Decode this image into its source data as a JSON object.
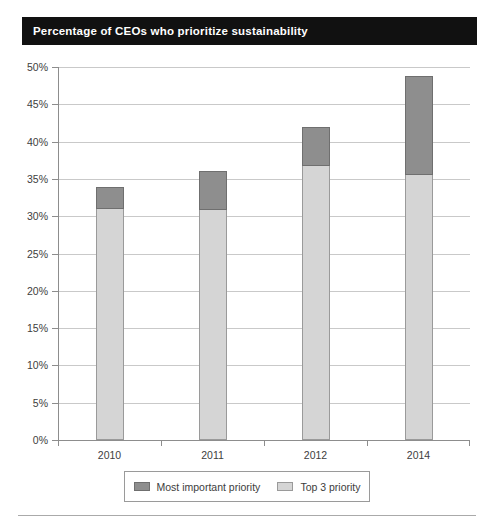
{
  "title": "Percentage of CEOs who prioritize sustainability",
  "colors": {
    "title_background": "#111111",
    "title_text": "#ffffff",
    "most_important": "#8e8e8e",
    "top3": "#d5d5d5",
    "axis": "#8d8d8d",
    "grid": "#c9c9c9"
  },
  "chart_data": {
    "type": "bar",
    "stacked": true,
    "title": "Percentage of CEOs who prioritize sustainability",
    "xlabel": "",
    "ylabel": "",
    "categories": [
      "2010",
      "2011",
      "2012",
      "2014"
    ],
    "series": [
      {
        "name": "Top 3 priority",
        "color": "#d5d5d5",
        "values": [
          30.9,
          30.8,
          36.7,
          35.5
        ]
      },
      {
        "name": "Most important priority",
        "color": "#8e8e8e",
        "values": [
          3.0,
          5.2,
          5.2,
          13.3
        ]
      }
    ],
    "totals": [
      33.9,
      36.0,
      41.9,
      48.8
    ],
    "ylim": [
      0,
      50
    ],
    "ytick_values": [
      0,
      5,
      10,
      15,
      20,
      25,
      30,
      35,
      40,
      45,
      50
    ],
    "ytick_labels": [
      "0%",
      "5%",
      "10%",
      "15%",
      "20%",
      "25%",
      "30%",
      "35%",
      "40%",
      "45%",
      "50%"
    ],
    "grid": true,
    "grid_axis": "y",
    "legend_position": "bottom"
  },
  "legend": {
    "entries": [
      {
        "label": "Most important priority",
        "swatch": "dark"
      },
      {
        "label": "Top 3 priority",
        "swatch": "light"
      }
    ]
  }
}
